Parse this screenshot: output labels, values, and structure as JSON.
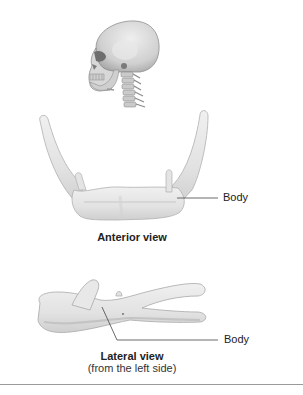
{
  "figure": {
    "panels": [
      {
        "id": "skull-context",
        "description": "Skull and cervical spine, lateral view"
      },
      {
        "id": "anterior",
        "caption": "Anterior view",
        "callouts": [
          {
            "label": "Body"
          }
        ]
      },
      {
        "id": "lateral",
        "caption": "Lateral view",
        "subcaption": "(from the left side)",
        "callouts": [
          {
            "label": "Body"
          }
        ]
      }
    ]
  },
  "colors": {
    "bone_fill": "#e6e6e6",
    "bone_shade": "#c9c9c9",
    "bone_outline": "#a8a8a8",
    "leader_line": "#444444",
    "rule": "#9a9a9a"
  }
}
